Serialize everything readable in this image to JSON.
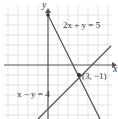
{
  "diagram": {
    "axes": {
      "x_label": "x",
      "y_label": "y"
    },
    "lines": [
      {
        "label": "2x + y = 5",
        "slope": -2,
        "intercept": 5
      },
      {
        "label": "x − y = 4",
        "slope": 1,
        "intercept": -4
      }
    ],
    "intersection": {
      "label": "(3, −1)",
      "x": 3,
      "y": -1
    },
    "colors": {
      "grid": "#d6d6d6",
      "axis": "#555555",
      "line": "#555555",
      "point": "#333333"
    }
  }
}
